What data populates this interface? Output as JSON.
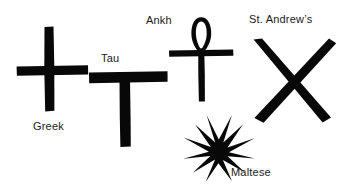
{
  "page": {
    "background_color": "#ffffff",
    "ink_color": "#080808",
    "width": 339,
    "height": 195
  },
  "figures": [
    {
      "id": "greek",
      "label": "Greek",
      "icon_name": "greek-cross-icon",
      "label_x": 33,
      "label_y": 120,
      "geometry": {
        "x": 16,
        "y": 26,
        "w": 74,
        "h": 86,
        "vertical_bar": {
          "x": 44,
          "y": 27,
          "w": 9,
          "h": 84
        },
        "horizontal_bar": {
          "x": 17,
          "y": 66,
          "w": 71,
          "h": 9
        }
      }
    },
    {
      "id": "tau",
      "label": "Tau",
      "icon_name": "tau-cross-icon",
      "label_x": 101,
      "label_y": 52,
      "geometry": {
        "x": 88,
        "y": 70,
        "w": 80,
        "h": 78,
        "horizontal_bar": {
          "x": 89,
          "y": 72,
          "w": 78,
          "h": 10
        },
        "vertical_bar": {
          "x": 120,
          "y": 80,
          "w": 10,
          "h": 66
        }
      }
    },
    {
      "id": "ankh",
      "label": "Ankh",
      "icon_name": "ankh-icon",
      "label_x": 146,
      "label_y": 14,
      "geometry": {
        "x": 168,
        "y": 16,
        "w": 66,
        "h": 88,
        "loop": {
          "cx": 201,
          "cy": 32,
          "rx": 9,
          "ry": 16
        },
        "horizontal_bar": {
          "x": 169,
          "y": 50,
          "w": 64,
          "h": 6
        },
        "vertical_bar": {
          "x": 198,
          "y": 48,
          "w": 6,
          "h": 53
        }
      }
    },
    {
      "id": "maltese",
      "label": "Maltese",
      "icon_name": "maltese-cross-icon",
      "label_x": 231,
      "label_y": 166,
      "geometry": {
        "cx": 218,
        "cy": 147,
        "outer_radius": 36,
        "inner_radius": 12,
        "points": 8,
        "rotation_deg": 22.5
      }
    },
    {
      "id": "st-andrews",
      "label": "St. Andrew’s",
      "icon_name": "saltire-cross-icon",
      "label_x": 249,
      "label_y": 13,
      "geometry": {
        "x": 250,
        "y": 38,
        "w": 82,
        "h": 86,
        "stroke_width": 11,
        "diagonal_1": {
          "x1": 254,
          "y1": 42,
          "x2": 328,
          "y2": 120
        },
        "diagonal_2": {
          "x1": 328,
          "y1": 42,
          "x2": 254,
          "y2": 120
        }
      }
    }
  ]
}
